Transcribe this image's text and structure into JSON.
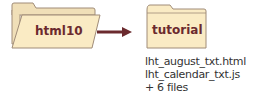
{
  "source_folder": {
    "label": "html10"
  },
  "target_folder": {
    "label": "tutorial"
  },
  "files": [
    "lht_august_txt.html",
    "lht_calendar_txt.js",
    "+ 6 files"
  ],
  "colors": {
    "folder_fill": "#faebc4",
    "folder_back": "#f0dfb8",
    "folder_stroke": "#a08c78",
    "arrow": "#6b2a2e",
    "label": "#6b2a2e"
  }
}
